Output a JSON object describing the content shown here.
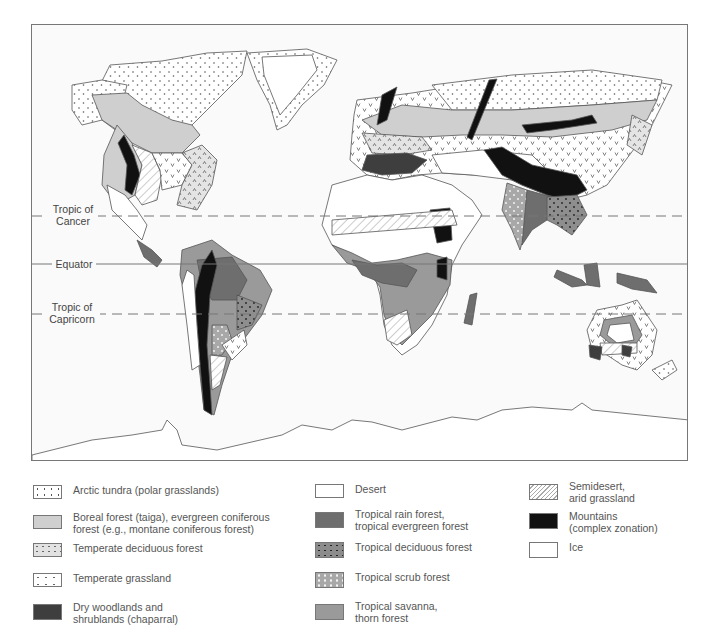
{
  "map": {
    "lines": {
      "tropic_of_cancer": {
        "label": "Tropic of\nCancer",
        "label_line1": "Tropic of",
        "label_line2": "Cancer",
        "style": "dashed"
      },
      "equator": {
        "label": "Equator",
        "style": "solid"
      },
      "tropic_of_capricorn": {
        "label": "Tropic of\nCapricorn",
        "label_line1": "Tropic of",
        "label_line2": "Capricorn",
        "style": "dashed"
      }
    },
    "colors": {
      "ocean": "#fafafa",
      "outline": "#555555",
      "tundra": "#ffffff",
      "boreal": "#cfcfcf",
      "temperate_deciduous": "#e2e2e2",
      "temperate_grassland": "#ffffff",
      "chaparral": "#3e3e3e",
      "desert": "#ffffff",
      "rainforest": "#6e6e6e",
      "tropical_deciduous": "#8c8c8c",
      "tropical_scrub": "#a8a8a8",
      "savanna": "#9a9a9a",
      "semidesert": "#ffffff",
      "mountains": "#111111",
      "ice": "#ffffff"
    }
  },
  "legend": {
    "columns": [
      {
        "items": [
          {
            "key": "arctic-tundra",
            "label": "Arctic tundra (polar grasslands)",
            "pattern": "dots"
          },
          {
            "key": "boreal-forest",
            "label": "Boreal forest (taiga), evergreen coniferous\nforest (e.g., montane coniferous forest)",
            "pattern": "light-gray"
          },
          {
            "key": "temperate-deciduous-forest",
            "label": "Temperate deciduous forest",
            "pattern": "carets"
          },
          {
            "key": "temperate-grassland",
            "label": "Temperate grassland",
            "pattern": "v-marks"
          },
          {
            "key": "dry-woodlands",
            "label": "Dry woodlands and\nshrublands (chaparral)",
            "pattern": "dark-gray"
          }
        ]
      },
      {
        "items": [
          {
            "key": "desert",
            "label": "Desert",
            "pattern": "white"
          },
          {
            "key": "tropical-rain-forest",
            "label": "Tropical rain forest,\ntropical evergreen forest",
            "pattern": "medium-dark-gray"
          },
          {
            "key": "tropical-deciduous-forest",
            "label": "Tropical deciduous forest",
            "pattern": "gray-dark-dots"
          },
          {
            "key": "tropical-scrub-forest",
            "label": "Tropical scrub forest",
            "pattern": "gray-white-dots"
          },
          {
            "key": "tropical-savanna",
            "label": "Tropical savanna,\nthorn forest",
            "pattern": "medium-gray"
          }
        ]
      },
      {
        "items": [
          {
            "key": "semidesert",
            "label": "Semidesert,\narid grassland",
            "pattern": "hatch"
          },
          {
            "key": "mountains",
            "label": "Mountains\n(complex zonation)",
            "pattern": "black"
          },
          {
            "key": "ice",
            "label": "Ice",
            "pattern": "white"
          }
        ]
      }
    ]
  }
}
